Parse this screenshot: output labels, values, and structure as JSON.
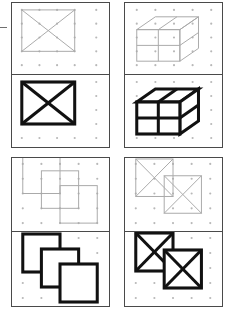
{
  "sheet": {
    "title": "Figure Copy Task Sheet",
    "description": "Four paired visual-motor copying items; each item shows a faint gray model figure drawn on a 5x5 dot grid above, and a heavy black copied figure below.",
    "background_color": "#ffffff",
    "frame_color": "#4a4a4a",
    "dot_color": "#b8b8b8",
    "model_stroke_color": "#a9a9a9",
    "copy_stroke_color": "#111111",
    "edge_mark": {
      "name": "left-edge-tick",
      "visible": true
    }
  },
  "grid": {
    "columns": 5,
    "rows": 5,
    "label": "5 x 5 dot grid"
  },
  "items": [
    {
      "id": "item-1",
      "position": "top-left",
      "model": {
        "name": "rectangle-with-x-model",
        "label": "Rectangle with inscribed X",
        "shape": "rectangle-x",
        "shading": "light"
      },
      "copy": {
        "name": "rectangle-with-x-copy",
        "label": "Rectangle with inscribed X",
        "shape": "rectangle-x",
        "shading": "bold"
      }
    },
    {
      "id": "item-2",
      "position": "top-right",
      "model": {
        "name": "cube-2x2-model",
        "label": "Three-dimensional cube divided into four cells",
        "shape": "cube-2x2",
        "shading": "light"
      },
      "copy": {
        "name": "cube-2x2-copy",
        "label": "Three-dimensional cube divided into four cells",
        "shape": "cube-2x2",
        "shading": "bold"
      }
    },
    {
      "id": "item-3",
      "position": "bottom-left",
      "model": {
        "name": "three-overlapping-squares-model",
        "label": "Three overlapping squares in diagonal cascade",
        "shape": "three-squares-cascade",
        "shading": "light"
      },
      "copy": {
        "name": "three-overlapping-squares-copy",
        "label": "Three overlapping squares in diagonal cascade",
        "shape": "three-squares-cascade",
        "shading": "bold"
      }
    },
    {
      "id": "item-4",
      "position": "bottom-right",
      "model": {
        "name": "two-overlapping-x-squares-model",
        "label": "Two overlapping squares each with an inscribed X",
        "shape": "two-x-squares",
        "shading": "light"
      },
      "copy": {
        "name": "two-overlapping-x-squares-copy",
        "label": "Two overlapping squares each with an inscribed X",
        "shape": "two-x-squares",
        "shading": "bold"
      }
    }
  ]
}
